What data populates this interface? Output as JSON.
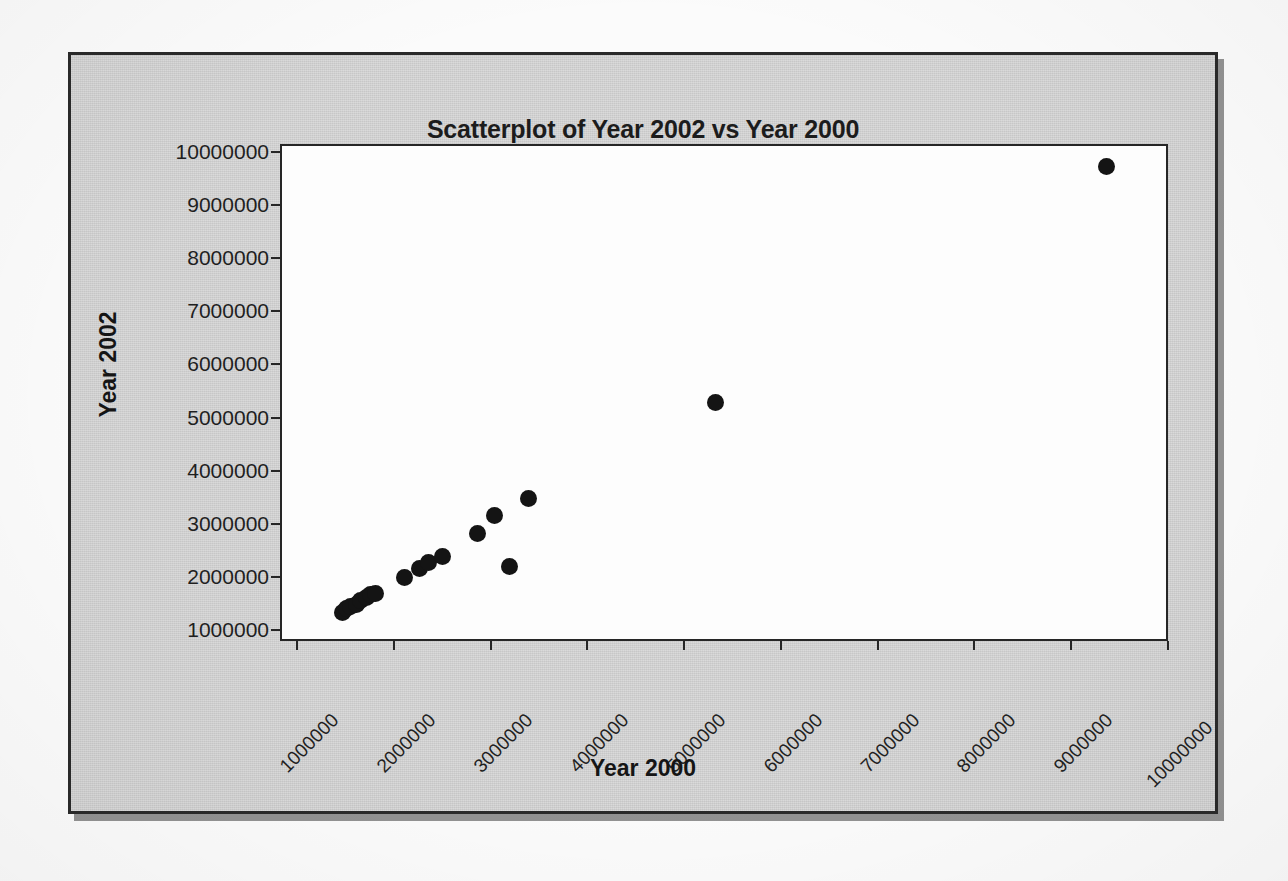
{
  "chart": {
    "title": "Scatterplot of Year 2002 vs Year 2000",
    "background_color": "#cfcfcf",
    "plot_background_color": "#fdfdfd",
    "frame_color": "#262626",
    "marker_color": "#141414"
  },
  "ghost_text": {
    "line1": "this is shown below",
    "line2": "scatterplot"
  },
  "chart_data": {
    "type": "scatter",
    "title": "Scatterplot of Year 2002 vs Year 2000",
    "xlabel": "Year 2000",
    "ylabel": "Year 2002",
    "xlim": [
      1000000,
      10000000
    ],
    "ylim": [
      1000000,
      10000000
    ],
    "grid": false,
    "legend": false,
    "xticks": [
      1000000,
      2000000,
      3000000,
      4000000,
      5000000,
      6000000,
      7000000,
      8000000,
      9000000,
      10000000
    ],
    "yticks": [
      1000000,
      2000000,
      3000000,
      4000000,
      5000000,
      6000000,
      7000000,
      8000000,
      9000000,
      10000000
    ],
    "xticklabels": [
      "1000000",
      "2000000",
      "3000000",
      "4000000",
      "5000000",
      "6000000",
      "7000000",
      "8000000",
      "9000000",
      "10000000"
    ],
    "yticklabels": [
      "1000000",
      "2000000",
      "3000000",
      "4000000",
      "5000000",
      "6000000",
      "7000000",
      "8000000",
      "9000000",
      "10000000"
    ],
    "xtick_rotation": -45,
    "series": [
      {
        "name": "Year 2002 vs Year 2000",
        "marker": "filled-circle",
        "color": "#141414",
        "points": [
          [
            1450000,
            1370000
          ],
          [
            1490000,
            1450000
          ],
          [
            1530000,
            1480000
          ],
          [
            1590000,
            1520000
          ],
          [
            1640000,
            1600000
          ],
          [
            1700000,
            1650000
          ],
          [
            1740000,
            1700000
          ],
          [
            1790000,
            1730000
          ],
          [
            2090000,
            2030000
          ],
          [
            2250000,
            2200000
          ],
          [
            2340000,
            2300000
          ],
          [
            2480000,
            2420000
          ],
          [
            2840000,
            2850000
          ],
          [
            3020000,
            3200000
          ],
          [
            3180000,
            2240000
          ],
          [
            3370000,
            3510000
          ],
          [
            5300000,
            5320000
          ],
          [
            9340000,
            9770000
          ]
        ]
      }
    ]
  }
}
